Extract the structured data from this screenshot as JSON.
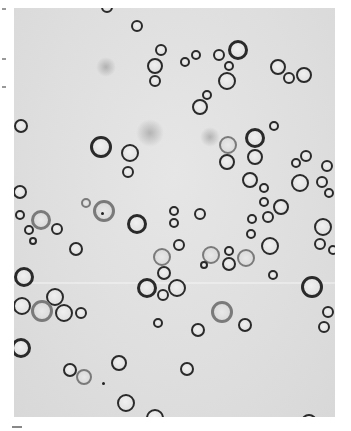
{
  "image": {
    "description": "Grayscale light-microscope photograph of round spherical cells/bubbles with dark outlines on a light gray background",
    "background_color": "#e0e0e0",
    "outline_color": "#2a2a2a",
    "frame": {
      "x": 14,
      "y": 8,
      "width": 321,
      "height": 409
    },
    "cells": [
      {
        "x": 137,
        "y": 26,
        "r": 6
      },
      {
        "x": 161,
        "y": 50,
        "r": 6
      },
      {
        "x": 155,
        "y": 66,
        "r": 8
      },
      {
        "x": 155,
        "y": 81,
        "r": 6
      },
      {
        "x": 196,
        "y": 55,
        "r": 5
      },
      {
        "x": 185,
        "y": 62,
        "r": 5
      },
      {
        "x": 219,
        "y": 55,
        "r": 6
      },
      {
        "x": 238,
        "y": 50,
        "r": 10
      },
      {
        "x": 229,
        "y": 66,
        "r": 5
      },
      {
        "x": 227,
        "y": 81,
        "r": 9
      },
      {
        "x": 278,
        "y": 67,
        "r": 8
      },
      {
        "x": 289,
        "y": 78,
        "r": 6
      },
      {
        "x": 304,
        "y": 75,
        "r": 8
      },
      {
        "x": 207,
        "y": 95,
        "r": 5
      },
      {
        "x": 200,
        "y": 107,
        "r": 8
      },
      {
        "x": 21,
        "y": 126,
        "r": 7
      },
      {
        "x": 274,
        "y": 126,
        "r": 5
      },
      {
        "x": 101,
        "y": 147,
        "r": 11
      },
      {
        "x": 130,
        "y": 153,
        "r": 9
      },
      {
        "x": 128,
        "y": 172,
        "r": 6
      },
      {
        "x": 228,
        "y": 145,
        "r": 9,
        "faint": true
      },
      {
        "x": 227,
        "y": 162,
        "r": 8
      },
      {
        "x": 255,
        "y": 138,
        "r": 10
      },
      {
        "x": 255,
        "y": 157,
        "r": 8
      },
      {
        "x": 306,
        "y": 156,
        "r": 6
      },
      {
        "x": 296,
        "y": 163,
        "r": 5
      },
      {
        "x": 300,
        "y": 183,
        "r": 9
      },
      {
        "x": 327,
        "y": 166,
        "r": 6
      },
      {
        "x": 322,
        "y": 182,
        "r": 6
      },
      {
        "x": 329,
        "y": 193,
        "r": 5
      },
      {
        "x": 20,
        "y": 192,
        "r": 7
      },
      {
        "x": 250,
        "y": 180,
        "r": 8
      },
      {
        "x": 264,
        "y": 188,
        "r": 5
      },
      {
        "x": 264,
        "y": 202,
        "r": 5
      },
      {
        "x": 281,
        "y": 207,
        "r": 8
      },
      {
        "x": 86,
        "y": 203,
        "r": 5,
        "faint": true
      },
      {
        "x": 104,
        "y": 211,
        "r": 11,
        "faint": true
      },
      {
        "x": 20,
        "y": 215,
        "r": 5
      },
      {
        "x": 41,
        "y": 220,
        "r": 10,
        "faint": true
      },
      {
        "x": 57,
        "y": 229,
        "r": 6
      },
      {
        "x": 29,
        "y": 230,
        "r": 5
      },
      {
        "x": 33,
        "y": 241,
        "r": 4
      },
      {
        "x": 137,
        "y": 224,
        "r": 10
      },
      {
        "x": 174,
        "y": 211,
        "r": 5
      },
      {
        "x": 174,
        "y": 223,
        "r": 5
      },
      {
        "x": 200,
        "y": 214,
        "r": 6
      },
      {
        "x": 252,
        "y": 219,
        "r": 5
      },
      {
        "x": 268,
        "y": 217,
        "r": 6
      },
      {
        "x": 251,
        "y": 234,
        "r": 5
      },
      {
        "x": 323,
        "y": 227,
        "r": 9
      },
      {
        "x": 320,
        "y": 244,
        "r": 6
      },
      {
        "x": 333,
        "y": 250,
        "r": 5
      },
      {
        "x": 76,
        "y": 249,
        "r": 7
      },
      {
        "x": 179,
        "y": 245,
        "r": 6
      },
      {
        "x": 270,
        "y": 246,
        "r": 9
      },
      {
        "x": 162,
        "y": 257,
        "r": 9,
        "faint": true
      },
      {
        "x": 211,
        "y": 255,
        "r": 9,
        "faint": true
      },
      {
        "x": 229,
        "y": 251,
        "r": 5
      },
      {
        "x": 246,
        "y": 258,
        "r": 9,
        "faint": true
      },
      {
        "x": 229,
        "y": 264,
        "r": 7
      },
      {
        "x": 204,
        "y": 265,
        "r": 4
      },
      {
        "x": 273,
        "y": 275,
        "r": 5
      },
      {
        "x": 24,
        "y": 277,
        "r": 10
      },
      {
        "x": 164,
        "y": 273,
        "r": 7
      },
      {
        "x": 147,
        "y": 288,
        "r": 10
      },
      {
        "x": 177,
        "y": 288,
        "r": 9
      },
      {
        "x": 163,
        "y": 295,
        "r": 6
      },
      {
        "x": 312,
        "y": 287,
        "r": 11
      },
      {
        "x": 55,
        "y": 297,
        "r": 9
      },
      {
        "x": 22,
        "y": 306,
        "r": 9
      },
      {
        "x": 42,
        "y": 311,
        "r": 11,
        "faint": true
      },
      {
        "x": 64,
        "y": 313,
        "r": 9
      },
      {
        "x": 81,
        "y": 313,
        "r": 6
      },
      {
        "x": 222,
        "y": 312,
        "r": 11,
        "faint": true
      },
      {
        "x": 328,
        "y": 312,
        "r": 6
      },
      {
        "x": 324,
        "y": 327,
        "r": 6
      },
      {
        "x": 158,
        "y": 323,
        "r": 5
      },
      {
        "x": 198,
        "y": 330,
        "r": 7
      },
      {
        "x": 245,
        "y": 325,
        "r": 7
      },
      {
        "x": 21,
        "y": 348,
        "r": 10
      },
      {
        "x": 70,
        "y": 370,
        "r": 7
      },
      {
        "x": 84,
        "y": 377,
        "r": 8,
        "faint": true
      },
      {
        "x": 119,
        "y": 363,
        "r": 8
      },
      {
        "x": 187,
        "y": 369,
        "r": 7
      },
      {
        "x": 126,
        "y": 403,
        "r": 9
      },
      {
        "x": 155,
        "y": 418,
        "r": 9
      },
      {
        "x": 309,
        "y": 422,
        "r": 8
      },
      {
        "x": 107,
        "y": 7,
        "r": 6
      }
    ],
    "smudges": [
      {
        "x": 150,
        "y": 133,
        "r": 14
      },
      {
        "x": 210,
        "y": 137,
        "r": 10
      },
      {
        "x": 106,
        "y": 67,
        "r": 10
      }
    ],
    "debris_dots": [
      {
        "x": 103,
        "y": 383
      },
      {
        "x": 102,
        "y": 213
      }
    ]
  }
}
